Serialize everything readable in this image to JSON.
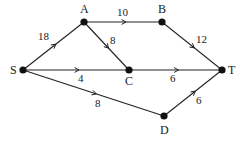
{
  "diagram": {
    "type": "directed-weighted-network",
    "colors": {
      "line": "#222222",
      "node": "#111111",
      "background": "#ffffff"
    },
    "nodes": [
      {
        "id": "S",
        "label": "S",
        "x": 23,
        "y": 70,
        "lx": 10,
        "ly": 74
      },
      {
        "id": "A",
        "label": "A",
        "x": 84,
        "y": 22,
        "lx": 80,
        "ly": 13
      },
      {
        "id": "B",
        "label": "B",
        "x": 162,
        "y": 22,
        "lx": 158,
        "ly": 13
      },
      {
        "id": "C",
        "label": "C",
        "x": 129,
        "y": 70,
        "lx": 125,
        "ly": 85
      },
      {
        "id": "T",
        "label": "T",
        "x": 222,
        "y": 70,
        "lx": 228,
        "ly": 74
      },
      {
        "id": "D",
        "label": "D",
        "x": 164,
        "y": 116,
        "lx": 160,
        "ly": 134
      }
    ],
    "edges": [
      {
        "from": "S",
        "to": "A",
        "weight": "18",
        "wx": 38,
        "wy": 40
      },
      {
        "from": "A",
        "to": "B",
        "weight": "10",
        "wx": 117,
        "wy": 16
      },
      {
        "from": "A",
        "to": "C",
        "weight": "8",
        "wx": 110,
        "wy": 44
      },
      {
        "from": "B",
        "to": "T",
        "weight": "12",
        "wx": 196,
        "wy": 43
      },
      {
        "from": "S",
        "to": "C",
        "weight": "4",
        "wx": 78,
        "wy": 82
      },
      {
        "from": "C",
        "to": "T",
        "weight": "6",
        "wx": 170,
        "wy": 82
      },
      {
        "from": "S",
        "to": "D",
        "weight": "8",
        "wx": 95,
        "wy": 107
      },
      {
        "from": "D",
        "to": "T",
        "weight": "6",
        "wx": 196,
        "wy": 104
      }
    ]
  }
}
